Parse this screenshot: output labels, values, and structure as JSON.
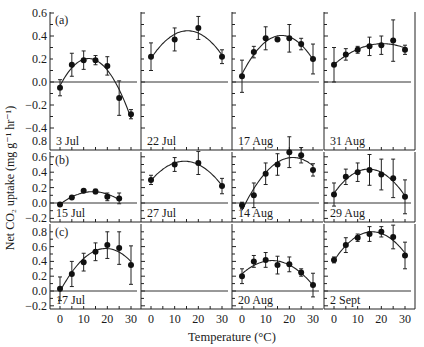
{
  "figure": {
    "ylabel": "Net CO₂ uptake (mg g⁻¹ hr⁻¹)",
    "xlabel": "Temperature (°C)",
    "x_ticks": [
      0,
      10,
      20,
      30
    ]
  },
  "chart_data": [
    {
      "type": "scatter",
      "row": "a",
      "panel_label": "(a)",
      "title": "3 Jul",
      "xlabel": "Temperature (°C)",
      "ylabel": "Net CO2 uptake (mg g-1 hr-1)",
      "ylim": [
        -0.4,
        0.6
      ],
      "y_ticks": [
        0.6,
        0.4,
        0.2,
        0.0,
        -0.2,
        -0.4
      ],
      "x": [
        0,
        5,
        10,
        15,
        20,
        25,
        30
      ],
      "y": [
        -0.05,
        0.15,
        0.19,
        0.19,
        0.14,
        -0.14,
        -0.28
      ],
      "err": [
        0.07,
        0.1,
        0.08,
        0.04,
        0.08,
        0.15,
        0.04
      ],
      "fit": "quadratic"
    },
    {
      "type": "scatter",
      "row": "a",
      "title": "22 Jul",
      "ylim": [
        -0.4,
        0.6
      ],
      "x": [
        0,
        10,
        20,
        30
      ],
      "y": [
        0.22,
        0.37,
        0.47,
        0.22
      ],
      "err": [
        0.12,
        0.1,
        0.1,
        0.06
      ],
      "fit": "quadratic"
    },
    {
      "type": "scatter",
      "row": "a",
      "title": "17 Aug",
      "ylim": [
        -0.4,
        0.6
      ],
      "x": [
        0,
        5,
        10,
        15,
        20,
        25,
        30
      ],
      "y": [
        0.05,
        0.26,
        0.38,
        0.37,
        0.38,
        0.33,
        0.2
      ],
      "err": [
        0.14,
        0.05,
        0.1,
        0.0,
        0.12,
        0.05,
        0.13
      ],
      "fit": "quadratic"
    },
    {
      "type": "scatter",
      "row": "a",
      "title": "31 Aug",
      "ylim": [
        -0.4,
        0.6
      ],
      "x": [
        0,
        5,
        10,
        15,
        20,
        25,
        30
      ],
      "y": [
        0.15,
        0.24,
        0.28,
        0.31,
        0.32,
        0.36,
        0.28
      ],
      "err": [
        0.15,
        0.05,
        0.03,
        0.08,
        0.08,
        0.18,
        0.04
      ],
      "fit": "quadratic"
    },
    {
      "type": "scatter",
      "row": "b",
      "panel_label": "(b)",
      "title": "15 Jul",
      "ylim": [
        -0.2,
        0.8
      ],
      "y_ticks": [
        0.8,
        0.6,
        0.4,
        0.2,
        0.0,
        -0.2
      ],
      "x": [
        0,
        5,
        10,
        15,
        20,
        25
      ],
      "y": [
        -0.02,
        0.07,
        0.16,
        0.15,
        0.08,
        0.06
      ],
      "err": [
        0.0,
        0.0,
        0.0,
        0.03,
        0.05,
        0.07
      ],
      "fit": "quadratic"
    },
    {
      "type": "scatter",
      "row": "b",
      "title": "27 Jul",
      "ylim": [
        -0.2,
        0.8
      ],
      "x": [
        0,
        10,
        20,
        30
      ],
      "y": [
        0.3,
        0.5,
        0.52,
        0.22
      ],
      "err": [
        0.06,
        0.09,
        0.15,
        0.1
      ],
      "fit": "quadratic"
    },
    {
      "type": "scatter",
      "row": "b",
      "title": "14 Aug",
      "ylim": [
        -0.2,
        0.8
      ],
      "x": [
        0,
        5,
        10,
        15,
        20,
        25,
        30
      ],
      "y": [
        -0.03,
        0.1,
        0.38,
        0.5,
        0.66,
        0.62,
        0.43
      ],
      "err": [
        0.04,
        0.16,
        0.14,
        0.14,
        0.2,
        0.1,
        0.08
      ],
      "fit": "quadratic"
    },
    {
      "type": "scatter",
      "row": "b",
      "title": "29 Aug",
      "ylim": [
        -0.2,
        0.8
      ],
      "x": [
        0,
        5,
        10,
        15,
        20,
        25,
        30
      ],
      "y": [
        0.11,
        0.34,
        0.4,
        0.43,
        0.37,
        0.32,
        0.08
      ],
      "err": [
        0.15,
        0.1,
        0.12,
        0.2,
        0.2,
        0.25,
        0.22
      ],
      "fit": "quadratic"
    },
    {
      "type": "scatter",
      "row": "c",
      "panel_label": "(c)",
      "title": "17 Jul",
      "ylim": [
        -0.2,
        0.8
      ],
      "y_ticks": [
        0.8,
        0.6,
        0.4,
        0.2,
        0.0,
        -0.2
      ],
      "x": [
        0,
        5,
        10,
        15,
        20,
        25,
        30
      ],
      "y": [
        0.03,
        0.23,
        0.39,
        0.53,
        0.62,
        0.58,
        0.35
      ],
      "err": [
        0.16,
        0.17,
        0.12,
        0.12,
        0.18,
        0.22,
        0.26
      ],
      "fit": "quadratic"
    },
    {
      "type": "scatter",
      "row": "c",
      "title": "",
      "ylim": [
        -0.2,
        0.8
      ],
      "x": [],
      "y": [],
      "err": [],
      "fit": "none"
    },
    {
      "type": "scatter",
      "row": "c",
      "title": "20 Aug",
      "ylim": [
        -0.2,
        0.8
      ],
      "x": [
        0,
        5,
        10,
        15,
        20,
        25,
        30
      ],
      "y": [
        0.2,
        0.4,
        0.42,
        0.35,
        0.36,
        0.25,
        0.08
      ],
      "err": [
        0.1,
        0.08,
        0.1,
        0.12,
        0.1,
        0.05,
        0.16
      ],
      "fit": "quadratic"
    },
    {
      "type": "scatter",
      "row": "c",
      "title": "2 Sept",
      "ylim": [
        -0.2,
        0.8
      ],
      "x": [
        0,
        5,
        10,
        15,
        20,
        25,
        30
      ],
      "y": [
        0.42,
        0.62,
        0.72,
        0.77,
        0.8,
        0.73,
        0.48
      ],
      "err": [
        0.04,
        0.1,
        0.05,
        0.1,
        0.07,
        0.16,
        0.18
      ],
      "fit": "quadratic"
    }
  ]
}
